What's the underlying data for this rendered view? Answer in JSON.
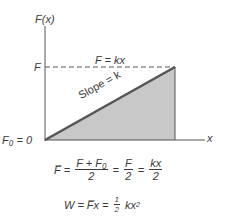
{
  "figure": {
    "y_axis_label": "F(x)",
    "x_axis_label": "x",
    "force_level_label": "F",
    "origin_label": "F₀ = 0",
    "line_label": "F = kx",
    "slope_label": "Slope = k",
    "colors": {
      "axis": "#555555",
      "line": "#555555",
      "fill": "#c8c8c8",
      "text": "#3a3a3a"
    }
  },
  "equations": {
    "avg_force": {
      "lhs": "F̅",
      "frac1_num": "F + F₀",
      "frac1_den": "2",
      "frac2_num": "F",
      "frac2_den": "2",
      "frac3_num": "kx",
      "frac3_den": "2"
    },
    "work": {
      "lhs": "W",
      "mid": "F̅x",
      "coef_num": "1",
      "coef_den": "2",
      "rhs": "kx",
      "exp": "2"
    },
    "equals": "="
  }
}
